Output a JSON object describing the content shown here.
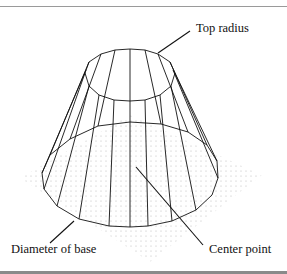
{
  "figure": {
    "labels": {
      "top_radius": "Top radius",
      "diameter_of_base": "Diameter of base",
      "center_point": "Center point"
    },
    "colors": {
      "line": "#111111",
      "dots": "#b8b8b8",
      "rules": "#9a9a9a"
    }
  }
}
